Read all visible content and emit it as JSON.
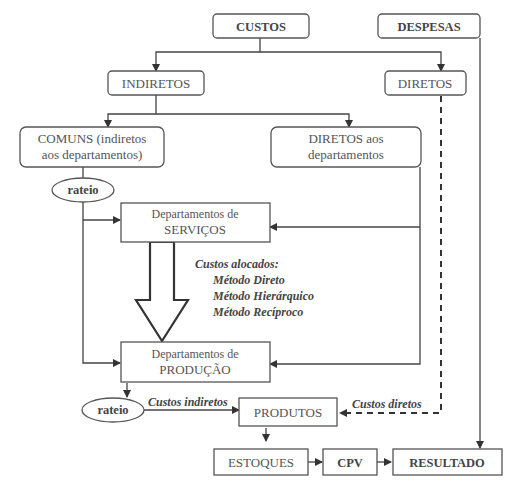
{
  "nodes": {
    "custos": "CUSTOS",
    "despesas": "DESPESAS",
    "indiretos": "INDIRETOS",
    "diretos": "DIRETOS",
    "comuns_line1": "COMUNS (indiretos",
    "comuns_line2": "aos departamentos)",
    "diretos_dept_line1": "DIRETOS aos",
    "diretos_dept_line2": "departamentos",
    "rateio_top": "rateio",
    "servicos_line1": "Departamentos de",
    "servicos_line2": "SERVIÇOS",
    "producao_line1": "Departamentos de",
    "producao_line2": "PRODUÇÃO",
    "rateio_bottom": "rateio",
    "produtos": "PRODUTOS",
    "estoques": "ESTOQUES",
    "cpv": "CPV",
    "resultado": "RESULTADO"
  },
  "labels": {
    "custos_alocados": "Custos alocados:",
    "metodos": [
      "Método Direto",
      "Método Hierárquico",
      "Método Recíproco"
    ],
    "custos_indiretos": "Custos indiretos",
    "custos_diretos": "Custos diretos"
  },
  "colors": {
    "stroke": "#555555",
    "text": "#555555",
    "background": "#ffffff"
  }
}
